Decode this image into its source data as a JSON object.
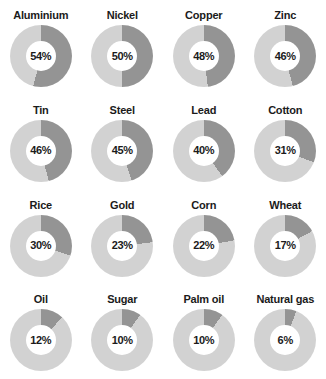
{
  "chart_data": {
    "type": "pie",
    "title": "",
    "subtitle": "",
    "xlabel": "",
    "ylabel": "",
    "layout": {
      "rows": 4,
      "columns": 4,
      "variant": "donut",
      "start_angle_deg": 0,
      "direction": "clockwise",
      "grid": false,
      "legend": "none",
      "value_suffix": "%"
    },
    "colors": {
      "filled_segment": "#949494",
      "remainder_segment": "#d2d2d2",
      "hole": "#ffffff",
      "text": "#1b1b1b",
      "background": "#ffffff"
    },
    "categories": [
      "Aluminium",
      "Nickel",
      "Copper",
      "Zinc",
      "Tin",
      "Steel",
      "Lead",
      "Cotton",
      "Rice",
      "Gold",
      "Corn",
      "Wheat",
      "Oil",
      "Sugar",
      "Palm oil",
      "Natural gas"
    ],
    "values": [
      54,
      50,
      48,
      46,
      46,
      45,
      40,
      31,
      30,
      23,
      22,
      17,
      12,
      10,
      10,
      6
    ],
    "value_labels": [
      "54%",
      "50%",
      "48%",
      "46%",
      "46%",
      "45%",
      "40%",
      "31%",
      "30%",
      "23%",
      "22%",
      "17%",
      "12%",
      "10%",
      "10%",
      "6%"
    ],
    "ylim": [
      0,
      100
    ]
  },
  "donuts": [
    {
      "label": "Aluminium",
      "value": 54,
      "value_label": "54%"
    },
    {
      "label": "Nickel",
      "value": 50,
      "value_label": "50%"
    },
    {
      "label": "Copper",
      "value": 48,
      "value_label": "48%"
    },
    {
      "label": "Zinc",
      "value": 46,
      "value_label": "46%"
    },
    {
      "label": "Tin",
      "value": 46,
      "value_label": "46%"
    },
    {
      "label": "Steel",
      "value": 45,
      "value_label": "45%"
    },
    {
      "label": "Lead",
      "value": 40,
      "value_label": "40%"
    },
    {
      "label": "Cotton",
      "value": 31,
      "value_label": "31%"
    },
    {
      "label": "Rice",
      "value": 30,
      "value_label": "30%"
    },
    {
      "label": "Gold",
      "value": 23,
      "value_label": "23%"
    },
    {
      "label": "Corn",
      "value": 22,
      "value_label": "22%"
    },
    {
      "label": "Wheat",
      "value": 17,
      "value_label": "17%"
    },
    {
      "label": "Oil",
      "value": 12,
      "value_label": "12%"
    },
    {
      "label": "Sugar",
      "value": 10,
      "value_label": "10%"
    },
    {
      "label": "Palm oil",
      "value": 10,
      "value_label": "10%"
    },
    {
      "label": "Natural gas",
      "value": 6,
      "value_label": "6%"
    }
  ]
}
